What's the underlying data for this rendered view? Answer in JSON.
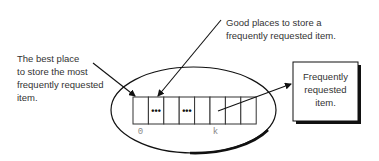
{
  "diagram": {
    "annotations": {
      "best_place": [
        "The best place",
        "to store the most",
        "frequently requested",
        "item."
      ],
      "good_places": [
        "Good places to store a",
        "frequently requested item."
      ]
    },
    "array": {
      "cell_count": 8,
      "cells": [
        "",
        "•••",
        "",
        "•••",
        "",
        "",
        "",
        ""
      ],
      "index_labels": {
        "first": "0",
        "k": "k"
      }
    },
    "item_box": {
      "lines": [
        "Frequently",
        "requested",
        "item."
      ]
    },
    "colors": {
      "stroke": "#111111",
      "text": "#333333",
      "index_text": "#888888",
      "background": "#ffffff"
    }
  }
}
